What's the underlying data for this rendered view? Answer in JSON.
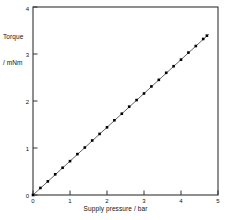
{
  "chart_data": {
    "type": "scatter",
    "title": "",
    "xlabel": "Supply pressure / bar",
    "ylabel_line1": "Torque",
    "ylabel_line2": "/ mNm",
    "xlim": [
      0,
      5
    ],
    "ylim": [
      0,
      4
    ],
    "xticks": [
      0,
      1,
      2,
      3,
      4,
      5
    ],
    "yticks": [
      0,
      1,
      2,
      3,
      4
    ],
    "xticklabels": [
      "0",
      "1",
      "2",
      "3",
      "4",
      "5"
    ],
    "yticklabels": [
      "0",
      "1",
      "2",
      "3",
      "4"
    ],
    "grid": false,
    "legend": null,
    "marker": "square",
    "marker_color": "#000000",
    "line_color": "#555555",
    "frame_color": "#333333",
    "series": [
      {
        "name": "Torque vs supply pressure",
        "x": [
          0.0,
          0.2,
          0.4,
          0.6,
          0.8,
          1.0,
          1.2,
          1.4,
          1.6,
          1.8,
          2.0,
          2.2,
          2.4,
          2.6,
          2.8,
          3.0,
          3.2,
          3.4,
          3.6,
          3.8,
          4.0,
          4.2,
          4.4,
          4.6,
          4.7
        ],
        "y": [
          0.0,
          0.15,
          0.29,
          0.44,
          0.58,
          0.72,
          0.87,
          1.01,
          1.16,
          1.3,
          1.44,
          1.59,
          1.73,
          1.88,
          2.02,
          2.16,
          2.31,
          2.45,
          2.6,
          2.74,
          2.88,
          3.03,
          3.17,
          3.32,
          3.39
        ]
      }
    ],
    "fit_line": {
      "x0": 0.0,
      "y0": 0.0,
      "x1": 4.75,
      "y1": 3.42,
      "slope": 0.72,
      "intercept": 0.0
    }
  }
}
